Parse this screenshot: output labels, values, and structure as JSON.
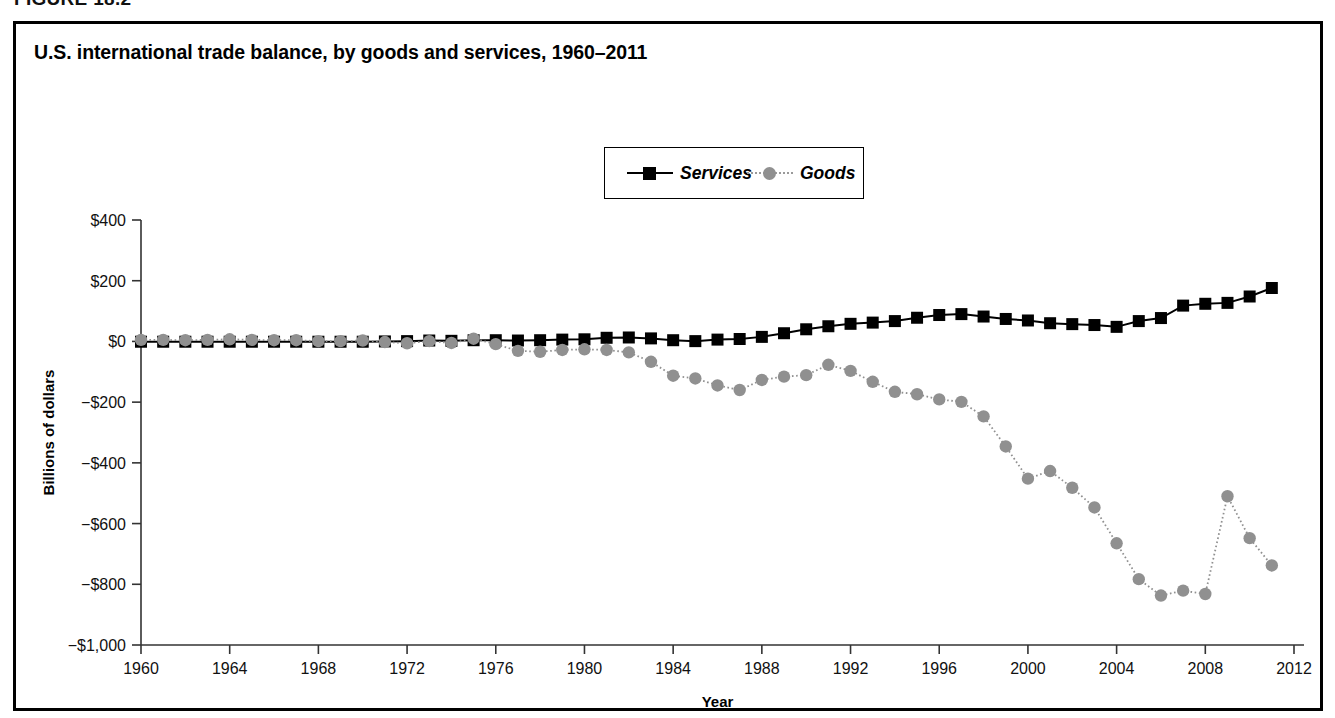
{
  "figure": {
    "label": "FIGURE 18.2",
    "title": "U.S. international trade balance, by goods and services, 1960–2011"
  },
  "legend": {
    "position": "top-center",
    "entries": [
      {
        "label": "Services",
        "marker": "filled-square",
        "color": "#000000",
        "line": "solid"
      },
      {
        "label": "Goods",
        "marker": "filled-circle",
        "color": "#909090",
        "line": "dotted"
      }
    ]
  },
  "chart_data": {
    "type": "line",
    "title": "U.S. international trade balance, by goods and services, 1960–2011",
    "xlabel": "Year",
    "ylabel": "Billions of dollars",
    "xlim": [
      1960,
      2012
    ],
    "ylim": [
      -1000,
      400
    ],
    "grid": false,
    "x_tick_labels": [
      "1960",
      "1964",
      "1968",
      "1972",
      "1976",
      "1980",
      "1984",
      "1988",
      "1992",
      "1996",
      "2000",
      "2004",
      "2008",
      "2012"
    ],
    "x_ticks": [
      1960,
      1964,
      1968,
      1972,
      1976,
      1980,
      1984,
      1988,
      1992,
      1996,
      2000,
      2004,
      2008,
      2012
    ],
    "y_tick_labels": [
      "$400",
      "$200",
      "$0",
      "−$200",
      "−$400",
      "−$600",
      "−$800",
      "−$1,000"
    ],
    "y_ticks": [
      400,
      200,
      0,
      -200,
      -400,
      -600,
      -800,
      -1000
    ],
    "x": [
      1960,
      1961,
      1962,
      1963,
      1964,
      1965,
      1966,
      1967,
      1968,
      1969,
      1970,
      1971,
      1972,
      1973,
      1974,
      1975,
      1976,
      1977,
      1978,
      1979,
      1980,
      1981,
      1982,
      1983,
      1984,
      1985,
      1986,
      1987,
      1988,
      1989,
      1990,
      1991,
      1992,
      1993,
      1994,
      1995,
      1996,
      1997,
      1998,
      1999,
      2000,
      2001,
      2002,
      2003,
      2004,
      2005,
      2006,
      2007,
      2008,
      2009,
      2010,
      2011
    ],
    "series": [
      {
        "name": "Services",
        "marker": "filled-square",
        "color": "#000000",
        "line": "solid",
        "values": [
          -1,
          -1,
          -1,
          -1,
          -1,
          -1,
          -1,
          -1,
          -1,
          -1,
          -1,
          0,
          1,
          3,
          2,
          4,
          4,
          3,
          4,
          6,
          7,
          12,
          13,
          10,
          4,
          1,
          6,
          8,
          15,
          27,
          40,
          50,
          58,
          62,
          67,
          78,
          87,
          90,
          82,
          74,
          69,
          60,
          57,
          54,
          48,
          67,
          77,
          118,
          124,
          127,
          148,
          176
        ]
      },
      {
        "name": "Goods",
        "marker": "filled-circle",
        "color": "#909090",
        "line": "dotted",
        "values": [
          5,
          5,
          4,
          5,
          7,
          5,
          4,
          4,
          1,
          1,
          3,
          -2,
          -6,
          1,
          -5,
          9,
          -9,
          -31,
          -34,
          -28,
          -26,
          -28,
          -36,
          -67,
          -113,
          -122,
          -145,
          -160,
          -127,
          -116,
          -111,
          -77,
          -97,
          -133,
          -166,
          -174,
          -191,
          -199,
          -247,
          -346,
          -452,
          -427,
          -482,
          -547,
          -665,
          -783,
          -837,
          -821,
          -832,
          -510,
          -648,
          -738
        ]
      }
    ]
  }
}
